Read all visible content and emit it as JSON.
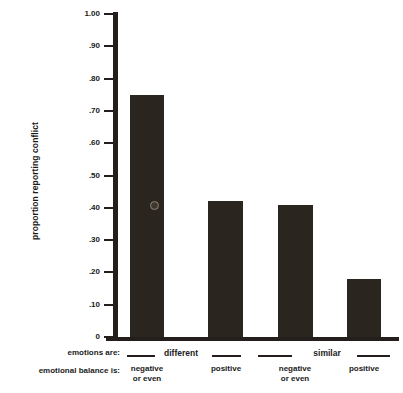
{
  "chart_data": {
    "type": "bar",
    "title": "",
    "subtitle": "",
    "xlabel": "",
    "ylabel": "proportion reporting conflict",
    "ylim": [
      0,
      1.0
    ],
    "grid": false,
    "legend": null,
    "categories": [
      "different / negative or even",
      "different / positive",
      "similar / negative or even",
      "similar / positive"
    ],
    "values": [
      0.75,
      0.42,
      0.41,
      0.18
    ],
    "y_ticks": [
      {
        "value": 1.0,
        "label": "1.00"
      },
      {
        "value": 0.9,
        "label": ".90"
      },
      {
        "value": 0.8,
        "label": ".80"
      },
      {
        "value": 0.7,
        "label": ".70"
      },
      {
        "value": 0.6,
        "label": ".60"
      },
      {
        "value": 0.5,
        "label": ".50"
      },
      {
        "value": 0.4,
        "label": ".40"
      },
      {
        "value": 0.3,
        "label": ".30"
      },
      {
        "value": 0.2,
        "label": ".20"
      },
      {
        "value": 0.1,
        "label": ".10"
      },
      {
        "value": 0.0,
        "label": "0"
      }
    ],
    "bar_color": "#2b2520",
    "axis_color": "#241f1c",
    "background_color": "#ffffff"
  },
  "axis": {
    "y_title": "proportion reporting conflict"
  },
  "bottom_rows": {
    "emotions_are_label": "emotions are:",
    "emotional_balance_label": "emotional balance is:",
    "groups": [
      {
        "label": "different"
      },
      {
        "label": "similar"
      }
    ],
    "conditions": [
      {
        "line1": "negative",
        "line2": "or even"
      },
      {
        "line1": "positive",
        "line2": ""
      },
      {
        "line1": "negative",
        "line2": "or even"
      },
      {
        "line1": "positive",
        "line2": ""
      }
    ]
  }
}
